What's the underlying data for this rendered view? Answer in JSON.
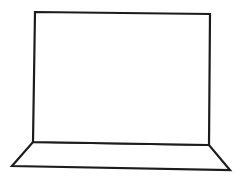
{
  "drawing": {
    "subject": "laptop-outline-icon",
    "stroke_color": "#1c1c1c",
    "background_color": "#ffffff",
    "screen": {
      "points": [
        [
          35,
          12
        ],
        [
          210,
          14
        ],
        [
          209,
          145
        ],
        [
          33,
          142
        ]
      ]
    },
    "base": {
      "points": [
        [
          33,
          142
        ],
        [
          209,
          145
        ],
        [
          230,
          170
        ],
        [
          12,
          166
        ]
      ]
    }
  }
}
